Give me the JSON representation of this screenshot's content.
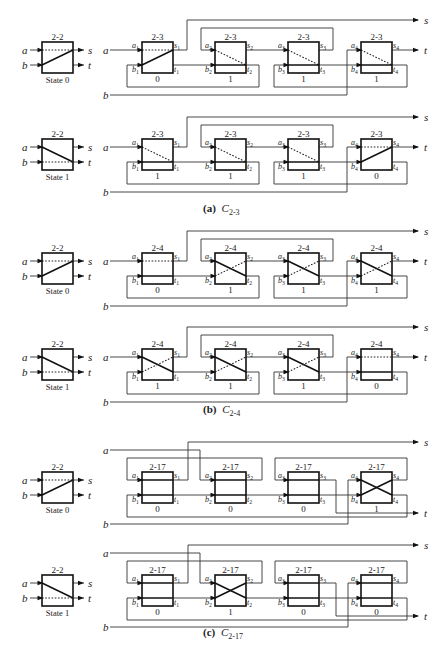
{
  "page_header": {
    "left": "3.3 Trade-off Between Internal and Non-Internal Failures (cropped)",
    "right": ""
  },
  "figure": {
    "subfigures": [
      {
        "id": "a",
        "caption_prefix": "(a)",
        "caption_symbol": "C",
        "caption_subscript": "2-3",
        "component_label": "2-3",
        "layout": "chain",
        "rows": [
          {
            "state_label": "State 0",
            "state": 0,
            "box_states": [
              0,
              1,
              1,
              1
            ]
          },
          {
            "state_label": "State 1",
            "state": 1,
            "box_states": [
              1,
              1,
              1,
              0
            ]
          }
        ]
      },
      {
        "id": "b",
        "caption_prefix": "(b)",
        "caption_symbol": "C",
        "caption_subscript": "2-4",
        "component_label": "2-4",
        "layout": "chain",
        "rows": [
          {
            "state_label": "State 0",
            "state": 0,
            "box_states": [
              0,
              1,
              1,
              1
            ]
          },
          {
            "state_label": "State 1",
            "state": 1,
            "box_states": [
              1,
              1,
              1,
              0
            ]
          }
        ]
      },
      {
        "id": "c",
        "caption_prefix": "(c)",
        "caption_symbol": "C",
        "caption_subscript": "2-17",
        "component_label": "2-17",
        "layout": "loops",
        "rows": [
          {
            "state_label": "State 0",
            "state": 0,
            "box_states": [
              0,
              0,
              0,
              1
            ]
          },
          {
            "state_label": "State 1",
            "state": 1,
            "box_states": [
              0,
              1,
              0,
              0
            ]
          }
        ]
      }
    ],
    "reference_box_label": "2-2",
    "input_labels": {
      "a": "a",
      "b": "b"
    },
    "output_labels": {
      "s": "s",
      "t": "t"
    },
    "port_labels": {
      "a": [
        "a1",
        "a2",
        "a3",
        "a4"
      ],
      "b": [
        "b1",
        "b2",
        "b3",
        "b4"
      ],
      "s": [
        "s1",
        "s2",
        "s3",
        "s4"
      ],
      "t": [
        "t1",
        "t2",
        "t3",
        "t4"
      ]
    }
  }
}
